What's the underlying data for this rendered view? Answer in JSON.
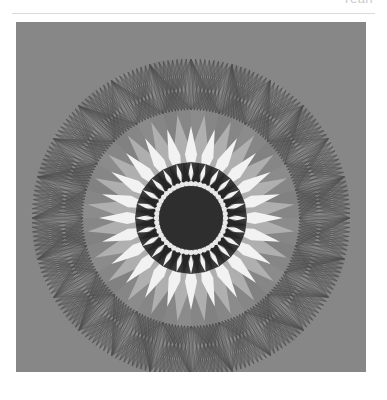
{
  "header": {
    "clipped_text": "Yeah"
  },
  "rule": {
    "color": "#d9dcdf"
  },
  "figure": {
    "alt_label": "circular spirograph mandala",
    "panel_background": "#878787",
    "caption_mark": ""
  },
  "chart_data": {
    "type": "scatter",
    "title": "",
    "subtitle": "",
    "xlabel": "",
    "ylabel": "",
    "grid": false,
    "legend_position": "none",
    "axis_visible": false,
    "xlim": [
      -1,
      1
    ],
    "ylim": [
      -1,
      1
    ],
    "background_color": "#878787",
    "center": {
      "cx": 175,
      "cy": 196
    },
    "outer_radius": 160,
    "symmetry_order": 24,
    "rings": [
      {
        "name": "core-disc",
        "kind": "filled-circle",
        "radius": 32,
        "color": "#2e2e2e"
      },
      {
        "name": "scalloped-ring",
        "kind": "scalloped-annulus",
        "inner_radius": 32,
        "outer_radius": 37,
        "color": "#e9e9e9",
        "scallop_count": 48
      },
      {
        "name": "dark-petal-ring",
        "kind": "zigzag-annulus",
        "inner_radius": 36,
        "outer_radius": 56,
        "color": "#262626",
        "point_count": 24
      },
      {
        "name": "white-petal-ring",
        "kind": "diamond-petals",
        "inner_radius": 36,
        "outer_radius": 92,
        "color": "#f2f2f2",
        "petal_count": 24
      },
      {
        "name": "light-gray-petal-ring",
        "kind": "diamond-petals",
        "inner_radius": 40,
        "outer_radius": 104,
        "color": "#b6b6b6",
        "petal_count": 24,
        "offset_degrees": 7.5
      },
      {
        "name": "wedge-field",
        "kind": "radial-wedges",
        "inner_radius": 90,
        "outer_radius": 160,
        "colors": [
          "#8f8f8f",
          "#7e7e7e"
        ],
        "wedge_count": 24
      },
      {
        "name": "string-art-annulus",
        "kind": "chord-web",
        "inner_radius": 108,
        "outer_radius": 160,
        "color": "#3a3a3a",
        "node_count": 24,
        "chords_per_node": 13,
        "line_width": 0.45
      }
    ],
    "palette": {
      "background": "#878787",
      "core": "#2e2e2e",
      "highlight": "#f2f2f2",
      "mid": "#b6b6b6",
      "shadow": "#262626",
      "line": "#3a3a3a"
    }
  }
}
